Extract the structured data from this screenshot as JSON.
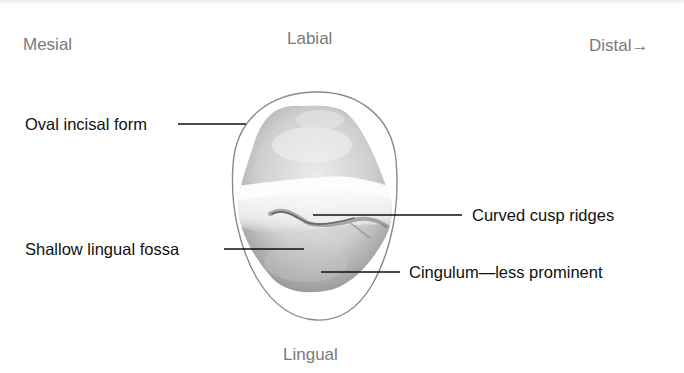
{
  "orientation": {
    "mesial": "Mesial",
    "labial": "Labial",
    "distal": "Distal→",
    "lingual": "Lingual"
  },
  "annotations": {
    "oval_incisal_form": "Oval incisal form",
    "curved_cusp_ridges": "Curved cusp ridges",
    "shallow_lingual_fossa": "Shallow lingual fossa",
    "cingulum": "Cingulum—less prominent"
  },
  "colors": {
    "direction_text": "#7a7a7a",
    "annotation_text": "#111111",
    "outline": "#8a8a8a",
    "leader_line": "#111111"
  }
}
